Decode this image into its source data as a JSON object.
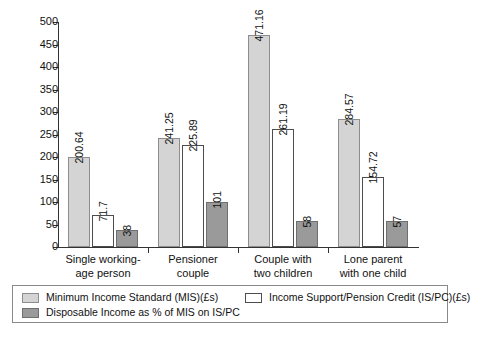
{
  "chart_data": {
    "type": "bar",
    "title": "",
    "xlabel": "",
    "ylabel": "",
    "ylim": [
      0,
      500
    ],
    "ytick_step": 50,
    "grid": false,
    "legend_position": "bottom",
    "categories": [
      "Single working-\nage person",
      "Pensioner\ncouple",
      "Couple with\ntwo children",
      "Lone parent\nwith one child"
    ],
    "category_lines": [
      [
        "Single working-",
        "age person"
      ],
      [
        "Pensioner",
        "couple"
      ],
      [
        "Couple with",
        "two children"
      ],
      [
        "Lone parent",
        "with one child"
      ]
    ],
    "yticks": [
      "0",
      "50",
      "100",
      "150",
      "200",
      "250",
      "300",
      "350",
      "400",
      "450",
      "500"
    ],
    "series": [
      {
        "name": "Minimum Income Standard (MIS)(£s)",
        "key": "mis",
        "color": "#d4d4d4",
        "values": [
          200.64,
          241.25,
          471.16,
          284.57
        ],
        "labels": [
          "200.64",
          "241.25",
          "471.16",
          "284.57"
        ]
      },
      {
        "name": "Income Support/Pension Credit (IS/PC)(£s)",
        "key": "ispc",
        "color": "#ffffff",
        "values": [
          71.7,
          225.89,
          261.19,
          154.72
        ],
        "labels": [
          "71.7",
          "225.89",
          "261.19",
          "154.72"
        ]
      },
      {
        "name": "Disposable Income as % of MIS on IS/PC",
        "key": "disp",
        "color": "#9a9a9a",
        "values": [
          38,
          101,
          58,
          57
        ],
        "labels": [
          "38",
          "101",
          "58",
          "57"
        ]
      }
    ]
  },
  "legend": {
    "items": [
      {
        "label": "Minimum Income Standard (MIS)(£s)",
        "swatch": "mis"
      },
      {
        "label": "Income Support/Pension Credit (IS/PC)(£s)",
        "swatch": "ispc"
      },
      {
        "label": "Disposable Income as % of MIS on IS/PC",
        "swatch": "disp"
      }
    ]
  }
}
